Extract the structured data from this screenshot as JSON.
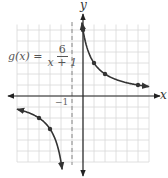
{
  "chart_data": {
    "type": "line",
    "title": "",
    "function_label": {
      "lhs": "g(x) =",
      "numerator": "6",
      "denominator": "x + 1"
    },
    "xlabel": "x",
    "ylabel": "y",
    "tick_labels": [
      {
        "axis": "x",
        "value": -1,
        "text": "−1"
      }
    ],
    "xlim": [
      -6,
      6
    ],
    "ylim": [
      -6,
      6.5
    ],
    "grid": true,
    "asymptote": {
      "type": "vertical",
      "x": -1,
      "style": "dashed"
    },
    "series": [
      {
        "name": "right branch",
        "points": [
          [
            0,
            6
          ],
          [
            1,
            3
          ],
          [
            2,
            2
          ],
          [
            5,
            1
          ]
        ],
        "x_range": [
          -0.1,
          6
        ]
      },
      {
        "name": "left branch",
        "points": [
          [
            -4,
            -2
          ],
          [
            -3,
            -3
          ]
        ],
        "x_range": [
          -6,
          -1.9
        ]
      }
    ],
    "colors": {
      "curve": "#333333",
      "grid": "#d8d8d8",
      "axis": "#222222",
      "asymptote": "#888888"
    }
  }
}
